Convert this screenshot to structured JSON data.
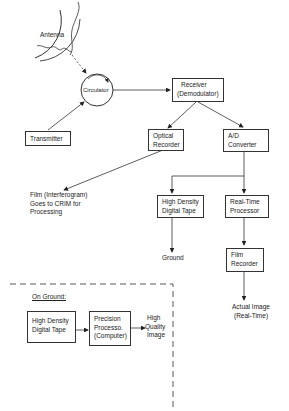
{
  "diagram": {
    "antenna": {
      "label": "Antenna"
    },
    "circulator": {
      "label": "Circulator"
    },
    "transmitter": {
      "label": "Transmitter"
    },
    "receiver": {
      "line1": "Receiver",
      "line2": "(Demodulator)"
    },
    "optical_recorder": {
      "line1": "Optical",
      "line2": "Recorder"
    },
    "ad_converter": {
      "line1": "A/D",
      "line2": "Converter"
    },
    "film_note": {
      "line1": "Film (Interferogram)",
      "line2": "Goes to CRIM for",
      "line3": "Processing"
    },
    "hd_tape": {
      "line1": "High Density",
      "line2": "Digital Tape"
    },
    "rt_processor": {
      "line1": "Real-Time",
      "line2": "Processor"
    },
    "ground_label": "Ground",
    "film_recorder": {
      "line1": "Film",
      "line2": "Recorder"
    },
    "actual_image": {
      "line1": "Actual Image",
      "line2": "(Real-Time)"
    },
    "on_ground": {
      "title": "On Ground:",
      "hd_tape": {
        "line1": "High Density",
        "line2": "Digital Tape"
      },
      "precision": {
        "line1": "Precision",
        "line2": "Processo.",
        "line3": "(Computer)"
      },
      "output": {
        "line1": "High",
        "line2": "Quality",
        "line3": "Image"
      }
    }
  }
}
